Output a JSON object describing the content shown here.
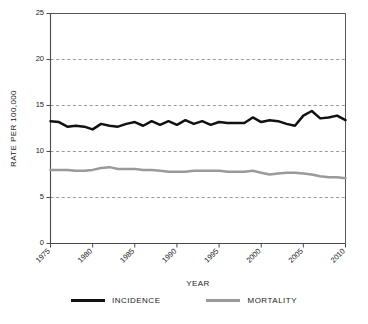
{
  "chart_data": {
    "type": "line",
    "title": "",
    "xlabel": "YEAR",
    "ylabel": "RATE PER 100,000",
    "xlim": [
      1975,
      2010
    ],
    "ylim": [
      0,
      25
    ],
    "grid": true,
    "legend_position": "bottom",
    "y_ticks": [
      0,
      5,
      10,
      15,
      20,
      25
    ],
    "y_tick_labels": [
      "0",
      "5",
      "10",
      "15",
      "20",
      "25"
    ],
    "x_ticks": [
      1975,
      1980,
      1985,
      1990,
      1995,
      2000,
      2005,
      2010
    ],
    "x_tick_labels": [
      "1975",
      "1980",
      "1985",
      "1990",
      "1995",
      "2000",
      "2005",
      "2010"
    ],
    "x": [
      1975,
      1976,
      1977,
      1978,
      1979,
      1980,
      1981,
      1982,
      1983,
      1984,
      1985,
      1986,
      1987,
      1988,
      1989,
      1990,
      1991,
      1992,
      1993,
      1994,
      1995,
      1996,
      1997,
      1998,
      1999,
      2000,
      2001,
      2002,
      2003,
      2004,
      2005,
      2006,
      2007,
      2008,
      2009,
      2010
    ],
    "series": [
      {
        "name": "INCIDENCE",
        "color": "#111111",
        "values": [
          13.3,
          13.2,
          12.7,
          12.8,
          12.7,
          12.4,
          13.0,
          12.8,
          12.7,
          13.0,
          13.2,
          12.8,
          13.3,
          12.9,
          13.3,
          12.9,
          13.4,
          13.0,
          13.3,
          12.9,
          13.2,
          13.1,
          13.1,
          13.1,
          13.7,
          13.2,
          13.4,
          13.3,
          13.0,
          12.8,
          13.9,
          14.4,
          13.6,
          13.7,
          13.9,
          13.4
        ]
      },
      {
        "name": "MORTALITY",
        "color": "#9a9a9a",
        "values": [
          8.0,
          8.0,
          8.0,
          7.9,
          7.9,
          8.0,
          8.2,
          8.3,
          8.1,
          8.1,
          8.1,
          8.0,
          8.0,
          7.9,
          7.8,
          7.8,
          7.8,
          7.9,
          7.9,
          7.9,
          7.9,
          7.8,
          7.8,
          7.8,
          7.9,
          7.7,
          7.5,
          7.6,
          7.7,
          7.7,
          7.6,
          7.5,
          7.3,
          7.2,
          7.2,
          7.1
        ]
      }
    ]
  },
  "legend": {
    "items": [
      {
        "label": "INCIDENCE",
        "color": "#111111"
      },
      {
        "label": "MORTALITY",
        "color": "#9a9a9a"
      }
    ]
  }
}
